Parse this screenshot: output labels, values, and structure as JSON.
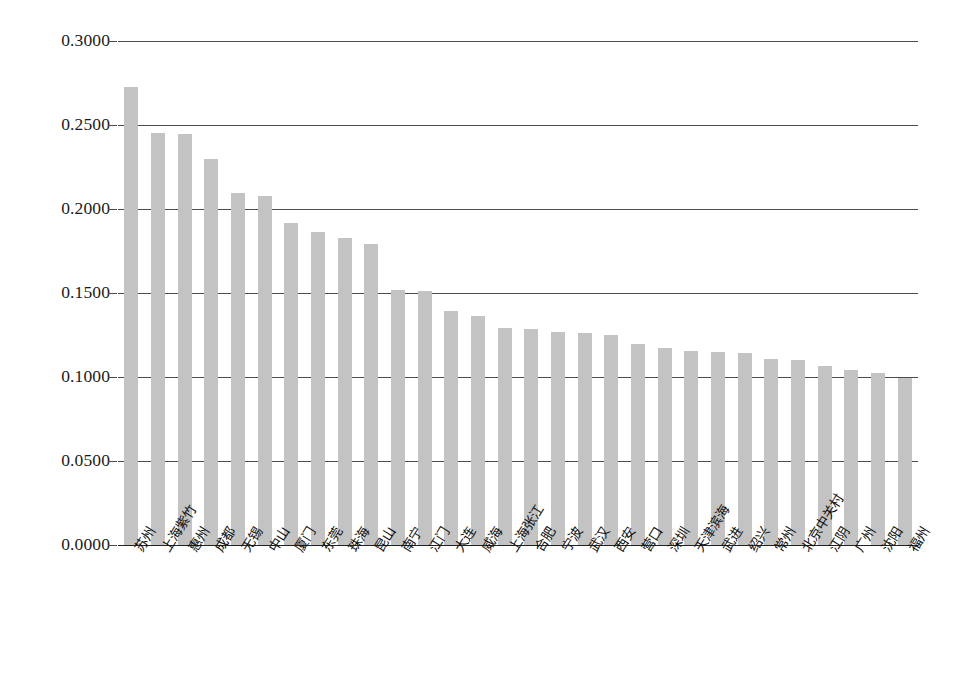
{
  "chart_data": {
    "type": "bar",
    "title": "",
    "xlabel": "",
    "ylabel": "",
    "ylim": [
      0.0,
      0.3
    ],
    "ytick_labels": [
      "0.3000",
      "0.2500",
      "0.2000",
      "0.1500",
      "0.1000",
      "0.0500",
      "0.0000"
    ],
    "ytick_values": [
      0.3,
      0.25,
      0.2,
      0.15,
      0.1,
      0.05,
      0.0
    ],
    "grid": true,
    "legend": null,
    "bar_color": "#c3c3c3",
    "axis_color": "#4a4a4a",
    "categories": [
      "苏州",
      "上海紫竹",
      "惠州",
      "成都",
      "无锡",
      "中山",
      "厦门",
      "东莞",
      "珠海",
      "昆山",
      "南宁",
      "江门",
      "大连",
      "威海",
      "上海张江",
      "合肥",
      "宁波",
      "武汉",
      "西安",
      "营口",
      "深圳",
      "天津滨海",
      "武进",
      "绍兴",
      "常州",
      "北京中关村",
      "江阴",
      "广州",
      "沈阳",
      "福州"
    ],
    "values": [
      0.2725,
      0.245,
      0.2448,
      0.23,
      0.2095,
      0.2075,
      0.1915,
      0.1865,
      0.1825,
      0.179,
      0.152,
      0.151,
      0.1395,
      0.1365,
      0.129,
      0.1285,
      0.1265,
      0.126,
      0.125,
      0.1195,
      0.117,
      0.1155,
      0.115,
      0.114,
      0.1105,
      0.11,
      0.1065,
      0.104,
      0.1025,
      0.0995
    ]
  }
}
